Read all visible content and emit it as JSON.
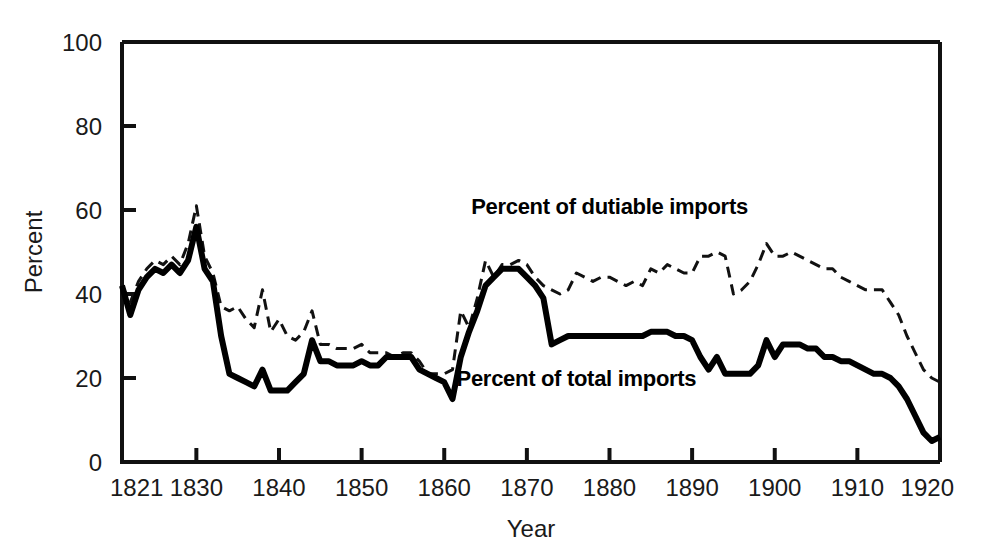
{
  "chart_data": {
    "type": "line",
    "title": "",
    "xlabel": "Year",
    "ylabel": "Percent",
    "xlim": [
      1821,
      1920
    ],
    "ylim": [
      0,
      100
    ],
    "grid": false,
    "legend_position": "inline-annotation",
    "xticks": [
      "1821",
      "1830",
      "1840",
      "1850",
      "1860",
      "1870",
      "1880",
      "1890",
      "1900",
      "1910",
      "1920"
    ],
    "xtick_values": [
      1821,
      1830,
      1840,
      1850,
      1860,
      1870,
      1880,
      1890,
      1900,
      1910,
      1920
    ],
    "yticks": [
      "0",
      "20",
      "40",
      "60",
      "80",
      "100"
    ],
    "ytick_values": [
      0,
      20,
      40,
      60,
      80,
      100
    ],
    "x": [
      1821,
      1822,
      1823,
      1824,
      1825,
      1826,
      1827,
      1828,
      1829,
      1830,
      1831,
      1832,
      1833,
      1834,
      1835,
      1836,
      1837,
      1838,
      1839,
      1840,
      1841,
      1842,
      1843,
      1844,
      1845,
      1846,
      1847,
      1848,
      1849,
      1850,
      1851,
      1852,
      1853,
      1854,
      1855,
      1856,
      1857,
      1858,
      1859,
      1860,
      1861,
      1862,
      1863,
      1864,
      1865,
      1866,
      1867,
      1868,
      1869,
      1870,
      1871,
      1872,
      1873,
      1874,
      1875,
      1876,
      1877,
      1878,
      1879,
      1880,
      1881,
      1882,
      1883,
      1884,
      1885,
      1886,
      1887,
      1888,
      1889,
      1890,
      1891,
      1892,
      1893,
      1894,
      1895,
      1896,
      1897,
      1898,
      1899,
      1900,
      1901,
      1902,
      1903,
      1904,
      1905,
      1906,
      1907,
      1908,
      1909,
      1910,
      1911,
      1912,
      1913,
      1914,
      1915,
      1916,
      1917,
      1918,
      1919,
      1920
    ],
    "series": [
      {
        "name": "Percent of dutiable imports",
        "style": "dashed",
        "color": "#111111",
        "values": [
          42,
          38,
          43,
          46,
          48,
          47,
          49,
          47,
          52,
          61,
          49,
          45,
          37,
          36,
          37,
          34,
          32,
          41,
          31,
          34,
          30,
          29,
          31,
          36,
          28,
          28,
          27,
          27,
          27,
          28,
          26,
          26,
          26,
          25,
          26,
          26,
          24,
          21,
          21,
          21,
          22,
          36,
          32,
          39,
          48,
          44,
          47,
          47,
          48,
          47,
          44,
          42,
          41,
          40,
          41,
          45,
          44,
          43,
          44,
          44,
          43,
          42,
          43,
          42,
          46,
          45,
          47,
          46,
          45,
          45,
          49,
          49,
          50,
          49,
          40,
          41,
          43,
          47,
          52,
          49,
          49,
          50,
          49,
          48,
          47,
          46,
          46,
          44,
          43,
          42,
          41,
          41,
          41,
          38,
          35,
          30,
          26,
          22,
          20,
          19
        ]
      },
      {
        "name": "Percent of total imports",
        "style": "solid",
        "color": "#000000",
        "values": [
          42,
          35,
          41,
          44,
          46,
          45,
          47,
          45,
          48,
          56,
          46,
          43,
          30,
          21,
          20,
          19,
          18,
          22,
          17,
          17,
          17,
          19,
          21,
          29,
          24,
          24,
          23,
          23,
          23,
          24,
          23,
          23,
          25,
          25,
          25,
          25,
          22,
          21,
          20,
          19,
          15,
          25,
          31,
          36,
          42,
          44,
          46,
          46,
          46,
          44,
          42,
          39,
          28,
          29,
          30,
          30,
          30,
          30,
          30,
          30,
          30,
          30,
          30,
          30,
          31,
          31,
          31,
          30,
          30,
          29,
          25,
          22,
          25,
          21,
          21,
          21,
          21,
          23,
          29,
          25,
          28,
          28,
          28,
          27,
          27,
          25,
          25,
          24,
          24,
          23,
          22,
          21,
          21,
          20,
          18,
          15,
          11,
          7,
          5,
          6
        ]
      }
    ],
    "annotations": [
      {
        "text": "Percent of dutiable imports",
        "x": 1880,
        "y": 59
      },
      {
        "text": "Percent of total imports",
        "x": 1876,
        "y": 18
      }
    ]
  }
}
